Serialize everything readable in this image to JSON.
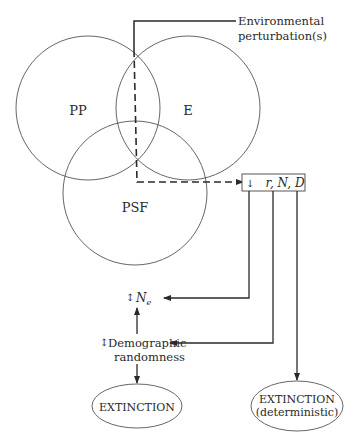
{
  "diagram": {
    "type": "extinction-vortex-flow",
    "circles": [
      {
        "id": "pp",
        "label": "PP"
      },
      {
        "id": "e",
        "label": "E"
      },
      {
        "id": "psf",
        "label": "PSF"
      }
    ],
    "input": {
      "line1": "Environmental",
      "line2": "perturbation(s)"
    },
    "box": {
      "arrow": "↓",
      "text": "r, N, D"
    },
    "ne": {
      "arrow": "↕",
      "text": "N",
      "subscript": "e"
    },
    "demographic": {
      "arrow": "↕",
      "line1": "Demographic",
      "line2": "randomness"
    },
    "outcomes": [
      {
        "id": "extinction",
        "line1": "EXTINCTION"
      },
      {
        "id": "extinction-deterministic",
        "line1": "EXTINCTION",
        "line2": "(deterministic)"
      }
    ],
    "colors": {
      "stroke": "#2a2a2a",
      "circle": "#555555"
    }
  }
}
